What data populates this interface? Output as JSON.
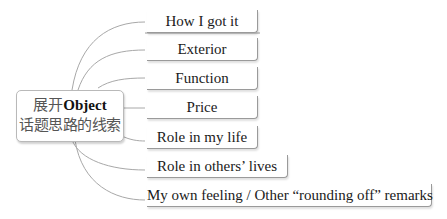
{
  "root": {
    "prefix": "展开",
    "bold": "Object",
    "line2": "话题思路的线索"
  },
  "branches": [
    {
      "label": "How I got it"
    },
    {
      "label": "Exterior"
    },
    {
      "label": "Function"
    },
    {
      "label": "Price"
    },
    {
      "label": "Role in my life"
    },
    {
      "label": "Role in others’ lives"
    },
    {
      "label": "My own feeling / Other “rounding off” remarks"
    }
  ],
  "colors": {
    "line": "#a8a8a8",
    "border": "#9a9a9a"
  }
}
